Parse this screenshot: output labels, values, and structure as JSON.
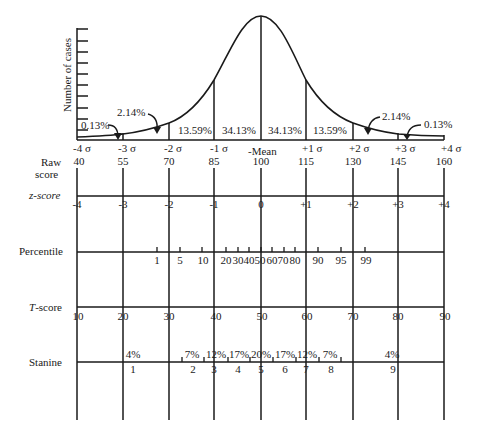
{
  "y_axis_label": "Number of cases",
  "curve_percents": {
    "left_tail": "0.13%",
    "left_2": "2.14%",
    "left_1": "13.59%",
    "left_0": "34.13%",
    "right_0": "34.13%",
    "right_1": "13.59%",
    "right_2": "2.14%",
    "right_tail": "0.13%"
  },
  "sigma_labels": [
    "-4 σ",
    "-3 σ",
    "-2 σ",
    "-1 σ",
    "-Mean",
    "+1 σ",
    "+2 σ",
    "+3 σ",
    "+4 σ"
  ],
  "rows": {
    "raw": {
      "label_line1": "Raw",
      "label_line2": "score",
      "values": [
        "40",
        "55",
        "70",
        "85",
        "100",
        "115",
        "130",
        "145",
        "160"
      ]
    },
    "z": {
      "label": "z-score",
      "values": [
        "-4",
        "-3",
        "-2",
        "-1",
        "0",
        "+1",
        "+2",
        "+3",
        "+4"
      ]
    },
    "percentile": {
      "label": "Percentile",
      "values": [
        "1",
        "5",
        "10",
        "20",
        "30",
        "40",
        "50",
        "60",
        "70",
        "80",
        "90",
        "95",
        "99"
      ]
    },
    "t": {
      "label": "T-score",
      "values": [
        "10",
        "20",
        "30",
        "40",
        "50",
        "60",
        "70",
        "80",
        "90"
      ]
    },
    "stanine": {
      "label": "Stanine",
      "percents": [
        "4%",
        "7%",
        "12%",
        "17%",
        "20%",
        "17%",
        "12%",
        "7%",
        "4%"
      ],
      "numbers": [
        "1",
        "2",
        "3",
        "4",
        "5",
        "6",
        "7",
        "8",
        "9"
      ]
    }
  }
}
